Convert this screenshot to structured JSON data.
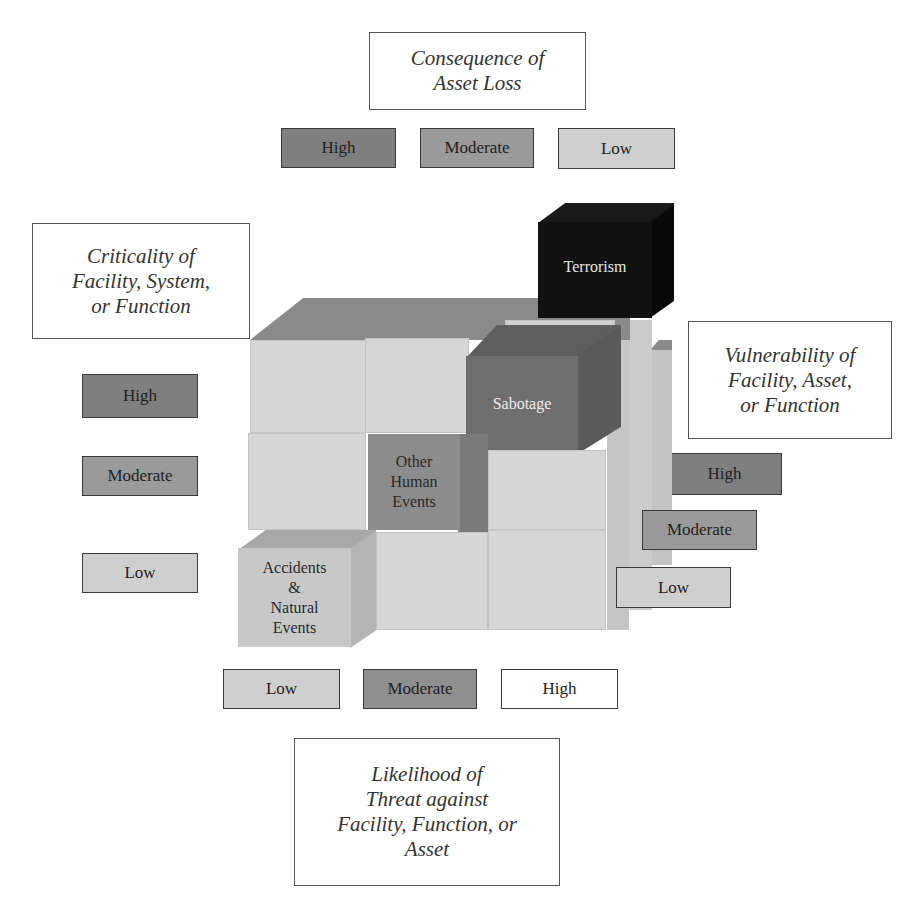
{
  "consequence": {
    "title_lines": [
      "Consequence of",
      "Asset Loss"
    ],
    "levels": [
      {
        "label": "High",
        "shade": "#7f7f7f"
      },
      {
        "label": "Moderate",
        "shade": "#9a9a9a"
      },
      {
        "label": "Low",
        "shade": "#cfcfcf"
      }
    ]
  },
  "criticality": {
    "title_lines": [
      "Criticality of",
      "Facility, System,",
      "or Function"
    ],
    "levels": [
      {
        "label": "High",
        "shade": "#7f7f7f"
      },
      {
        "label": "Moderate",
        "shade": "#9a9a9a"
      },
      {
        "label": "Low",
        "shade": "#cfcfcf"
      }
    ]
  },
  "vulnerability": {
    "title_lines": [
      "Vulnerability of",
      "Facility, Asset,",
      "or Function"
    ],
    "levels": [
      {
        "label": "High",
        "shade": "#7f7f7f"
      },
      {
        "label": "Moderate",
        "shade": "#9a9a9a"
      },
      {
        "label": "Low",
        "shade": "#cfcfcf"
      }
    ]
  },
  "likelihood": {
    "title_lines": [
      "Likelihood of",
      "Threat against",
      "Facility, Function, or",
      "Asset"
    ],
    "levels": [
      {
        "label": "Low",
        "shade": "#cfcfcf"
      },
      {
        "label": "Moderate",
        "shade": "#8f8f8f"
      },
      {
        "label": "High",
        "shade": "#ffffff"
      }
    ]
  },
  "threats": {
    "terrorism": {
      "label": "Terrorism",
      "color": "#111111"
    },
    "sabotage": {
      "label": "Sabotage",
      "color": "#6e6e6e"
    },
    "other_human": {
      "lines": [
        "Other",
        "Human",
        "Events"
      ],
      "color": "#8c8c8c"
    },
    "accidents": {
      "lines": [
        "Accidents",
        "&",
        "Natural",
        "Events"
      ],
      "color": "#c8c8c8"
    }
  }
}
